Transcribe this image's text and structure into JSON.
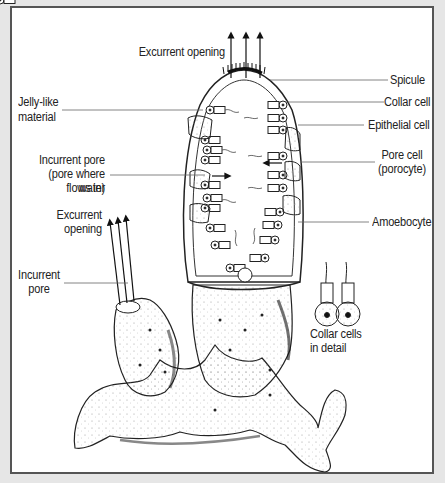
{
  "diagram": {
    "colors": {
      "background": "#e6e6e6",
      "panel": "#ffffff",
      "border": "#555555",
      "ink": "#222222",
      "line": "#666666"
    },
    "labels": {
      "excurrent_opening_top": "Excurrent opening",
      "spicule": "Spicule",
      "jelly_like": "Jelly-like",
      "material": "material",
      "collar_cell": "Collar cell",
      "epithelial_cell": "Epithelial cell",
      "incurrent_pore_1": "Incurrent pore",
      "incurrent_pore_2": "(pore where water",
      "incurrent_pore_3": "flows in)",
      "pore_cell_1": "Pore cell",
      "pore_cell_2": "(porocyte)",
      "excurrent_left_1": "Excurrent",
      "excurrent_left_2": "opening",
      "amoebocyte": "Amoebocyte",
      "incurrent_left_1": "Incurrent",
      "incurrent_left_2": "pore",
      "collar_detail_1": "Collar cells",
      "collar_detail_2": "in detail"
    }
  }
}
